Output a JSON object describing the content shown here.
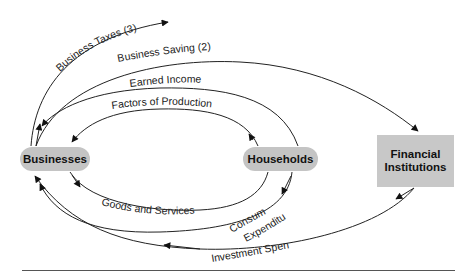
{
  "diagram": {
    "nodes": {
      "businesses": "Businesses",
      "households": "Households",
      "financial_line1": "Financial",
      "financial_line2": "Institutions"
    },
    "flows": {
      "business_taxes": "Business Taxes (3)",
      "business_saving": "Business Saving (2)",
      "earned_income": "Earned Income",
      "factors_of_production": "Factors of Production",
      "goods_and_services": "Goods and Services",
      "consumption_line1": "Consumption",
      "consumption_line2": "Expenditures",
      "investment_spending": "Investment Spending (1)"
    },
    "colors": {
      "node_fill": "#c4c4c4",
      "line": "#222222",
      "text": "#111111"
    }
  }
}
